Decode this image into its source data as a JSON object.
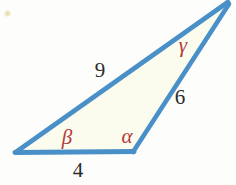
{
  "figure": {
    "type": "triangle-diagram",
    "colors": {
      "stroke": "#4a90c8",
      "fill": "#fbfbee",
      "angle_label": "#b03a3a",
      "side_label": "#2b2b2b",
      "background": "#fdfdfb"
    },
    "vertices": [
      {
        "name": "bottom-left",
        "x": 17,
        "y": 152,
        "angle_label": "β"
      },
      {
        "name": "bottom-right",
        "x": 133,
        "y": 151,
        "angle_label": "α"
      },
      {
        "name": "apex",
        "x": 228,
        "y": 3,
        "angle_label": "γ"
      }
    ],
    "sides": [
      {
        "name": "base",
        "label": "4",
        "from": "bottom-left",
        "to": "bottom-right"
      },
      {
        "name": "right-side",
        "label": "6",
        "from": "bottom-right",
        "to": "apex"
      },
      {
        "name": "long-side",
        "label": "9",
        "from": "apex",
        "to": "bottom-left"
      }
    ],
    "angle_labels": [
      {
        "name": "beta",
        "text": "β",
        "x": 67,
        "y": 137
      },
      {
        "name": "alpha",
        "text": "α",
        "x": 127,
        "y": 136
      },
      {
        "name": "gamma",
        "text": "γ",
        "x": 183,
        "y": 45
      }
    ],
    "side_labels": [
      {
        "name": "side-9",
        "text": "9",
        "x": 100,
        "y": 70
      },
      {
        "name": "side-6",
        "text": "6",
        "x": 180,
        "y": 97
      },
      {
        "name": "side-4",
        "text": "4",
        "x": 78,
        "y": 170
      }
    ]
  }
}
